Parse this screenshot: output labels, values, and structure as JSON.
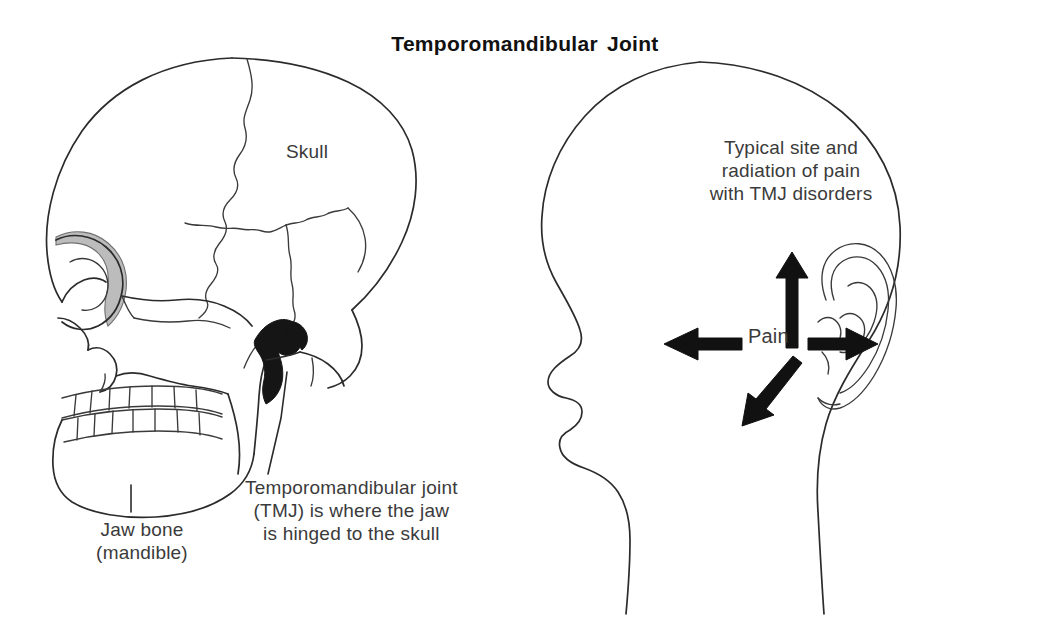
{
  "figure": {
    "title": "Temporomandibular Joint",
    "domain_subject": "anatomical line drawing of skull and head profile"
  },
  "left_panel": {
    "name": "skull lateral view",
    "labels": {
      "skull": "Skull",
      "jaw_bone": "Jaw bone\n(mandible)",
      "tmj": "Temporomandibular joint\n(TMJ) is where the jaw\nis hinged to the skull"
    },
    "markers": {
      "joint_marker": "filled black condyle / joint region",
      "orbit_shading": "grey shaded orbital rim"
    }
  },
  "right_panel": {
    "name": "head profile with ear",
    "labels": {
      "pain": "Pain",
      "typical_site": "Typical site and\nradiation of pain\nwith TMJ disorders"
    },
    "arrows": [
      {
        "name": "pain-arrow-up",
        "direction": "up"
      },
      {
        "name": "pain-arrow-left",
        "direction": "left"
      },
      {
        "name": "pain-arrow-down-left",
        "direction": "down-left"
      },
      {
        "name": "pain-arrow-right-to-ear",
        "direction": "right"
      }
    ]
  },
  "colors": {
    "ink": "#2b2b2b",
    "text": "#3b3b3b",
    "title": "#111111",
    "fill_black": "#151515",
    "shade_grey": "#bcbcbc",
    "background": "#ffffff"
  }
}
